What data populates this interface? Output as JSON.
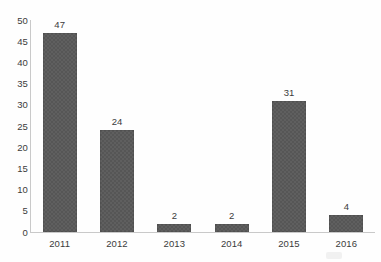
{
  "chart_data": {
    "type": "bar",
    "title": "",
    "subtitle": "",
    "xlabel": "",
    "ylabel": "",
    "categories": [
      "2011",
      "2012",
      "2013",
      "2014",
      "2015",
      "2016"
    ],
    "values": [
      47,
      24,
      2,
      2,
      31,
      4
    ],
    "value_labels": [
      "47",
      "24",
      "2",
      "2",
      "31",
      "4"
    ],
    "ylim": [
      0,
      50
    ],
    "ytick_step": 5,
    "yticks": [
      "50",
      "45",
      "40",
      "35",
      "30",
      "25",
      "20",
      "15",
      "10",
      "5",
      "0"
    ],
    "ytick_values": [
      50,
      45,
      40,
      35,
      30,
      25,
      20,
      15,
      10,
      5,
      0
    ],
    "grid": false,
    "legend": null,
    "legend_position": "none",
    "orientation": "vertical",
    "bar_color": "#565656",
    "axis_color": "#c9c9c9",
    "text_color": "#3b3b3b",
    "background_color": "#fefefe",
    "annotations": []
  },
  "artifacts": {
    "watermark_text": ""
  }
}
